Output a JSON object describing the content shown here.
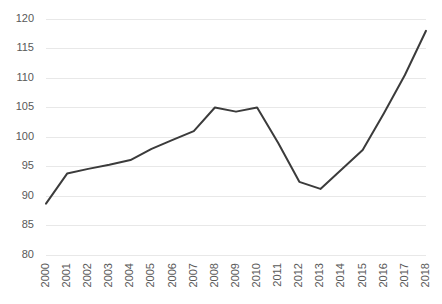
{
  "chart_data": {
    "type": "line",
    "title": "",
    "xlabel": "",
    "ylabel": "",
    "categories": [
      "2000",
      "2001",
      "2002",
      "2003",
      "2004",
      "2005",
      "2006",
      "2007",
      "2008",
      "2009",
      "2010",
      "2011",
      "2012",
      "2013",
      "2014",
      "2015",
      "2016",
      "2017",
      "2018"
    ],
    "values": [
      88.7,
      93.8,
      94.6,
      95.3,
      96.1,
      98.0,
      99.5,
      101.0,
      105.0,
      104.3,
      105.0,
      99.0,
      92.4,
      91.2,
      94.5,
      97.8,
      104.0,
      110.5,
      118.0
    ],
    "series": [
      {
        "name": "series-1",
        "values": [
          88.7,
          93.8,
          94.6,
          95.3,
          96.1,
          98.0,
          99.5,
          101.0,
          105.0,
          104.3,
          105.0,
          99.0,
          92.4,
          91.2,
          94.5,
          97.8,
          104.0,
          110.5,
          118.0
        ]
      }
    ],
    "ylim": [
      80,
      120
    ],
    "y_ticks": [
      80,
      85,
      90,
      95,
      100,
      105,
      110,
      115,
      120
    ],
    "y_tick_labels": [
      "80",
      "85",
      "90",
      "95",
      "100",
      "105",
      "110",
      "115",
      "120"
    ],
    "grid": true,
    "grid_axis": "y",
    "legend": false,
    "legend_position": "none",
    "line_color": "#3b3b3b",
    "grid_color": "#e8e8e8",
    "tick_label_color": "#595959",
    "background_color": "#ffffff",
    "x_tick_rotation": -90
  }
}
